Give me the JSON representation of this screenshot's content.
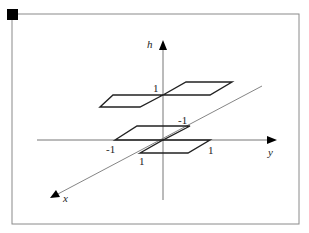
{
  "diagram": {
    "type": "3d-axes-with-parallelograms",
    "axes": {
      "vertical": {
        "label": "h"
      },
      "horizontal": {
        "label": "y"
      },
      "depth": {
        "label": "x"
      }
    },
    "tick_labels": {
      "h_one": "1",
      "y_neg_one": "-1",
      "y_one": "1",
      "x_neg_one": "-1",
      "x_one": "1"
    },
    "colors": {
      "frame": "#888888",
      "axis": "#777777",
      "shape": "#222222",
      "corner_marker": "#000000"
    }
  }
}
